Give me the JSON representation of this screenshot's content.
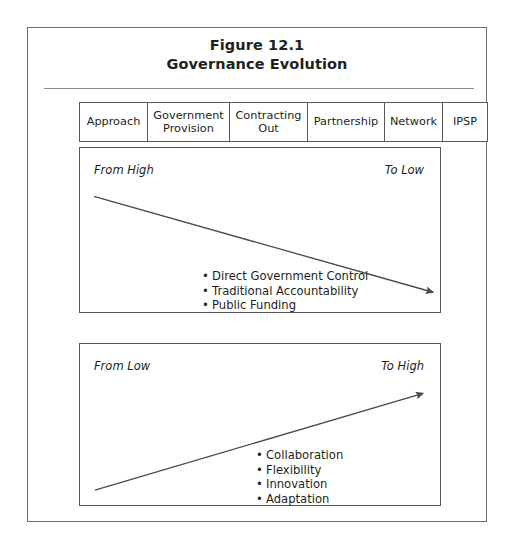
{
  "figure": {
    "title_line_1": "Figure 12.1",
    "title_line_2": "Governance Evolution"
  },
  "approach_table": {
    "cells": [
      {
        "label": "Approach"
      },
      {
        "label": "Government\nProvision"
      },
      {
        "label": "Contracting\nOut"
      },
      {
        "label": "Partnership"
      },
      {
        "label": "Network"
      },
      {
        "label": "IPSP"
      }
    ]
  },
  "downward_panel": {
    "left_label": "From High",
    "right_label": "To Low",
    "arrow_direction": "down-right",
    "bullets": [
      "Direct Government Control",
      "Traditional Accountability",
      "Public Funding"
    ]
  },
  "upward_panel": {
    "left_label": "From Low",
    "right_label": "To High",
    "arrow_direction": "up-right",
    "bullets": [
      "Collaboration",
      "Flexibility",
      "Innovation",
      "Adaptation"
    ]
  },
  "colors": {
    "frame_border": "#6e6e72",
    "box_border": "#58585b",
    "rule": "#8c8c90",
    "text": "#231f20",
    "arrow": "#4a4a4e"
  }
}
